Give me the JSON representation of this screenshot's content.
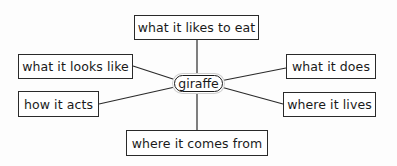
{
  "diagram": {
    "type": "concept-web",
    "center": {
      "label": "giraffe"
    },
    "nodes": [
      {
        "id": "eat",
        "label": "what it likes to eat"
      },
      {
        "id": "looks",
        "label": "what it looks like"
      },
      {
        "id": "does",
        "label": "what it does"
      },
      {
        "id": "acts",
        "label": "how it acts"
      },
      {
        "id": "lives",
        "label": "where it lives"
      },
      {
        "id": "from",
        "label": "where it comes from"
      }
    ],
    "colors": {
      "line": "#2a2a2a",
      "box_border": "#2a2a2a",
      "background": "#fdfdfd"
    }
  }
}
